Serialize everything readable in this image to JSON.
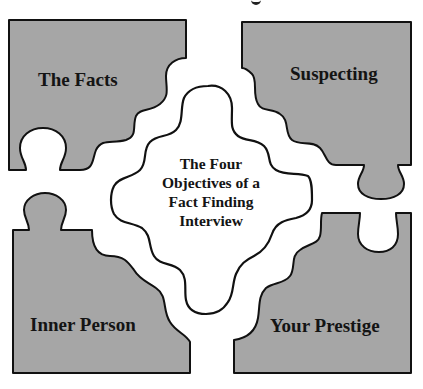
{
  "diagram": {
    "type": "jigsaw-puzzle",
    "colors": {
      "piece_fill": "#a6a6a6",
      "outline": "#111111",
      "center_fill": "#ffffff",
      "text": "#141414"
    },
    "center": {
      "lines": [
        "The Four",
        "Objectives of a",
        "Fact Finding",
        "Interview"
      ]
    },
    "pieces": [
      {
        "position": "top-left",
        "label": "The Facts"
      },
      {
        "position": "top-right",
        "label": "Suspecting"
      },
      {
        "position": "bottom-left",
        "label": "Inner Person"
      },
      {
        "position": "bottom-right",
        "label": "Your Prestige"
      }
    ]
  }
}
